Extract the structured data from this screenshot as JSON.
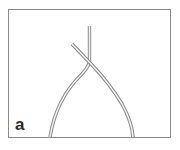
{
  "figure": {
    "panel_label": "a",
    "frame_color": "#8a8a8a",
    "strand_outline_color": "#8c8c8c",
    "strand_fill_color": "#f4f4f4",
    "background": "#ffffff"
  },
  "elements": [
    {
      "name": "strand-vertical",
      "description": "strand entering from top, bending down-left"
    },
    {
      "name": "strand-diagonal",
      "description": "strand entering from upper-left, crossing and bending down-right"
    }
  ]
}
